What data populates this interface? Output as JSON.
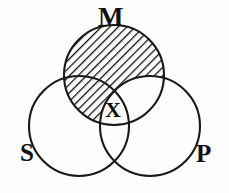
{
  "figure": {
    "type": "venn-diagram",
    "background_color": "#fdfdfb",
    "stroke_color": "#1a1a1a",
    "hatch_color": "#111111"
  },
  "labels": {
    "middle_term": "M",
    "subject_term": "S",
    "predicate_term": "P"
  },
  "marks": {
    "existential_x": "X"
  },
  "circles": [
    {
      "name": "M",
      "label": "M",
      "cx": 114,
      "cy": 75,
      "r": 50,
      "shaded": true
    },
    {
      "name": "S",
      "label": "S",
      "cx": 79,
      "cy": 126,
      "r": 50,
      "shaded": false
    },
    {
      "name": "P",
      "label": "P",
      "cx": 150,
      "cy": 126,
      "r": 50,
      "shaded": false
    }
  ],
  "shading": {
    "region": "M minus P",
    "pattern": "diagonal-hatch",
    "angle_degrees": 45,
    "spacing_px": 6
  },
  "x_mark": {
    "region": "M and S and P",
    "x": 114,
    "y": 110
  }
}
